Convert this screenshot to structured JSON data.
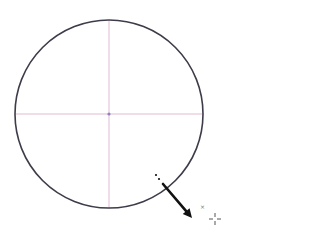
{
  "canvas": {
    "width": 235,
    "height": 238,
    "background": "#ffffff"
  },
  "circle": {
    "cx": 109,
    "cy": 114,
    "r": 94,
    "stroke": "#3d3d4a",
    "stroke_width": 1.6
  },
  "guides": {
    "color": "#d9a9c6",
    "horizontal": {
      "x1": 15,
      "x2": 203,
      "y": 114
    },
    "vertical": {
      "x": 109,
      "y1": 20,
      "y2": 208
    }
  },
  "center_point": {
    "cx": 109,
    "cy": 114,
    "r": 1.6,
    "color": "#8f84c0"
  },
  "arrow": {
    "color": "#111111",
    "start": {
      "x": 163,
      "y": 184
    },
    "end": {
      "x": 192,
      "y": 218
    },
    "dots": [
      {
        "x": 156,
        "y": 175
      },
      {
        "x": 159,
        "y": 179
      }
    ]
  },
  "marker": {
    "symbol": "×",
    "x": 202,
    "y": 207
  },
  "cursor": {
    "type": "crosshair",
    "x": 215,
    "y": 219,
    "color": "#555555"
  }
}
